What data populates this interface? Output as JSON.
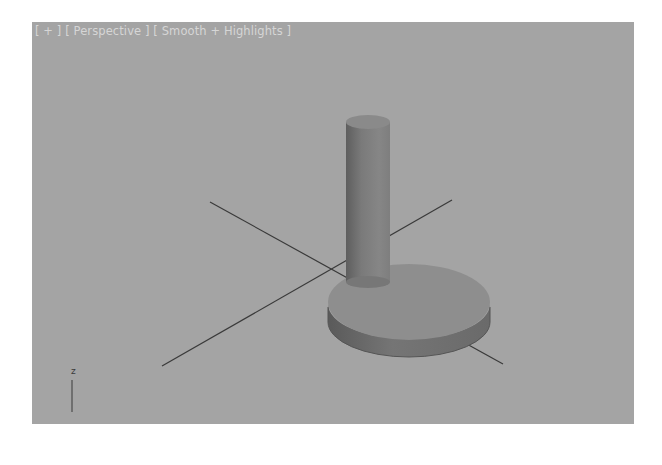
{
  "viewport": {
    "labels": {
      "menu": "[ + ]",
      "view": "[ Perspective ]",
      "shading": "[ Smooth + Highlights ]"
    },
    "background_color": "#a4a4a4",
    "grid_line_color": "#3a3a3a",
    "object_color": "#8c8c8c",
    "axis_tripod": {
      "label": "z"
    }
  }
}
